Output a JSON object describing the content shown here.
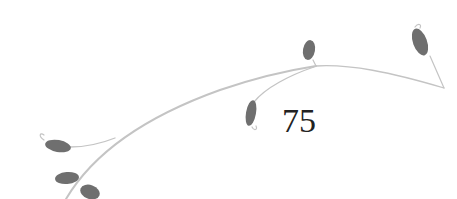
{
  "page": {
    "number": "75"
  },
  "ornament": {
    "icon": "vine-with-leaves-icon",
    "stem_color": "#c8c8c8",
    "leaf_color": "#6f6f6f"
  }
}
